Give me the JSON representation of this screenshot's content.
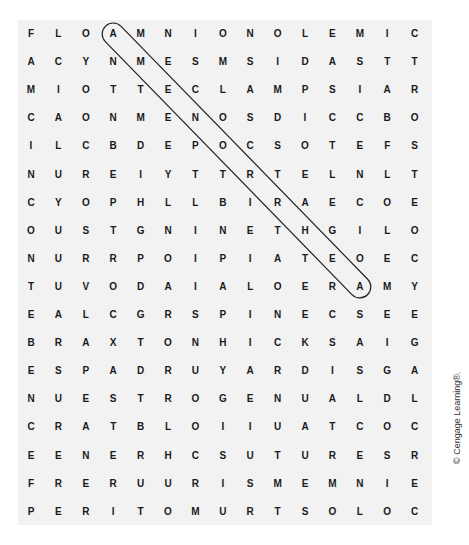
{
  "puzzle": {
    "rows": 18,
    "cols": 15,
    "grid": [
      [
        "F",
        "L",
        "O",
        "A",
        "M",
        "N",
        "I",
        "O",
        "N",
        "O",
        "L",
        "E",
        "M",
        "I",
        "C"
      ],
      [
        "A",
        "C",
        "Y",
        "N",
        "M",
        "E",
        "S",
        "M",
        "S",
        "I",
        "D",
        "A",
        "S",
        "T",
        "T"
      ],
      [
        "M",
        "I",
        "O",
        "T",
        "T",
        "E",
        "C",
        "L",
        "A",
        "M",
        "P",
        "S",
        "I",
        "A",
        "R"
      ],
      [
        "C",
        "A",
        "O",
        "N",
        "M",
        "E",
        "N",
        "O",
        "S",
        "D",
        "I",
        "C",
        "C",
        "B",
        "O"
      ],
      [
        "I",
        "L",
        "C",
        "B",
        "D",
        "E",
        "P",
        "O",
        "C",
        "S",
        "O",
        "T",
        "E",
        "F",
        "S"
      ],
      [
        "N",
        "U",
        "R",
        "E",
        "I",
        "Y",
        "T",
        "T",
        "R",
        "T",
        "E",
        "L",
        "N",
        "L",
        "T"
      ],
      [
        "C",
        "Y",
        "O",
        "P",
        "H",
        "L",
        "L",
        "B",
        "I",
        "R",
        "A",
        "E",
        "C",
        "O",
        "E"
      ],
      [
        "O",
        "U",
        "S",
        "T",
        "G",
        "N",
        "I",
        "N",
        "E",
        "T",
        "H",
        "G",
        "I",
        "L",
        "O"
      ],
      [
        "N",
        "U",
        "R",
        "R",
        "P",
        "O",
        "I",
        "P",
        "I",
        "A",
        "T",
        "E",
        "O",
        "E",
        "C"
      ],
      [
        "T",
        "U",
        "V",
        "O",
        "D",
        "A",
        "I",
        "A",
        "L",
        "O",
        "E",
        "R",
        "A",
        "M",
        "Y"
      ],
      [
        "E",
        "A",
        "L",
        "C",
        "G",
        "R",
        "S",
        "P",
        "I",
        "N",
        "E",
        "C",
        "S",
        "E",
        "E"
      ],
      [
        "B",
        "R",
        "A",
        "X",
        "T",
        "O",
        "N",
        "H",
        "I",
        "C",
        "K",
        "S",
        "A",
        "I",
        "G"
      ],
      [
        "E",
        "S",
        "P",
        "A",
        "D",
        "R",
        "U",
        "Y",
        "A",
        "R",
        "D",
        "I",
        "S",
        "G",
        "A"
      ],
      [
        "N",
        "U",
        "E",
        "S",
        "T",
        "R",
        "O",
        "G",
        "E",
        "N",
        "U",
        "A",
        "L",
        "D",
        "L"
      ],
      [
        "C",
        "R",
        "A",
        "T",
        "B",
        "L",
        "O",
        "I",
        "I",
        "U",
        "A",
        "T",
        "C",
        "O",
        "C"
      ],
      [
        "E",
        "E",
        "N",
        "E",
        "R",
        "H",
        "C",
        "S",
        "U",
        "T",
        "U",
        "R",
        "E",
        "S",
        "R"
      ],
      [
        "F",
        "R",
        "E",
        "R",
        "U",
        "U",
        "R",
        "I",
        "S",
        "M",
        "E",
        "M",
        "N",
        "I",
        "E"
      ],
      [
        "P",
        "E",
        "R",
        "I",
        "T",
        "O",
        "M",
        "U",
        "R",
        "T",
        "S",
        "O",
        "L",
        "O",
        "C"
      ]
    ],
    "found_words": [
      {
        "word": "AMENORRHEA",
        "start": {
          "row": 0,
          "col": 3
        },
        "end": {
          "row": 9,
          "col": 12
        },
        "direction": "diagonal-down-right"
      }
    ]
  },
  "copyright": "© Cengage Learning®.",
  "colors": {
    "background": "#ffffff",
    "puzzle_background": "#f2f2f2",
    "letter": "#1a1a1a",
    "highlight_stroke": "#222222"
  }
}
